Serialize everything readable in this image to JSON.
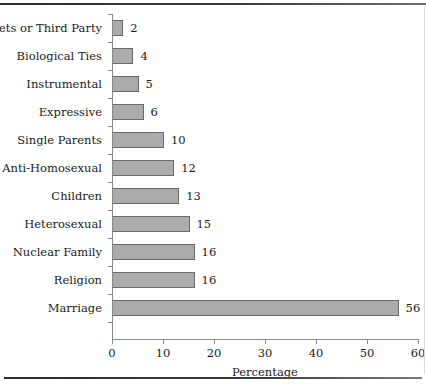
{
  "chart_data": {
    "type": "bar",
    "orientation": "horizontal",
    "title": "",
    "xlabel": "Percentage",
    "ylabel": "",
    "xlim": [
      0,
      60
    ],
    "xticks": [
      0,
      10,
      20,
      30,
      40,
      50,
      60
    ],
    "grid": false,
    "legend": null,
    "bar_color": "#ababab",
    "bar_edge_color": "#6a6a6a",
    "axis_color": "#8a8a8a",
    "categories": [
      "Pets or Third Party",
      "Biological Ties",
      "Instrumental",
      "Expressive",
      "Single Parents",
      "Anti-Homosexual",
      "Children",
      "Heterosexual",
      "Nuclear Family",
      "Religion",
      "Marriage"
    ],
    "values": [
      2,
      4,
      5,
      6,
      10,
      12,
      13,
      15,
      16,
      16,
      56
    ],
    "data_labels": [
      "2",
      "4",
      "5",
      "6",
      "10",
      "12",
      "13",
      "15",
      "16",
      "16",
      "56"
    ],
    "tick_labels": [
      "0",
      "10",
      "20",
      "30",
      "40",
      "50",
      "60"
    ]
  }
}
